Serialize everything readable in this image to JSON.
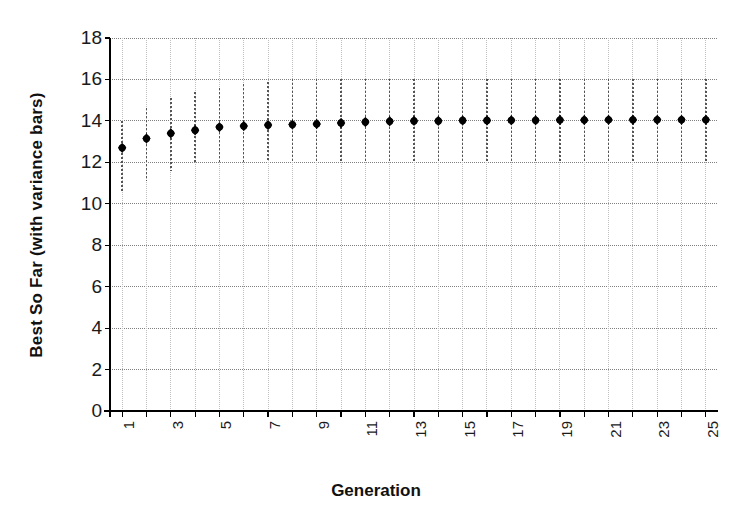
{
  "chart_data": {
    "type": "scatter",
    "title": "",
    "xlabel": "Generation",
    "ylabel": "Best So Far (with variance bars)",
    "xlim": [
      0.5,
      25.5
    ],
    "ylim": [
      0,
      18
    ],
    "grid": true,
    "legend": "none",
    "marker": "filled-diamond-circle",
    "error_bar_style": "dotted-vertical",
    "y_ticks": [
      0,
      2,
      4,
      6,
      8,
      10,
      12,
      14,
      16,
      18
    ],
    "x_ticks": [
      1,
      2,
      3,
      4,
      5,
      6,
      7,
      8,
      9,
      10,
      11,
      12,
      13,
      14,
      15,
      16,
      17,
      18,
      19,
      20,
      21,
      22,
      23,
      24,
      25
    ],
    "x_tick_labels_shown": [
      1,
      3,
      5,
      7,
      9,
      11,
      13,
      15,
      17,
      19,
      21,
      23,
      25
    ],
    "x": [
      1,
      2,
      3,
      4,
      5,
      6,
      7,
      8,
      9,
      10,
      11,
      12,
      13,
      14,
      15,
      16,
      17,
      18,
      19,
      20,
      21,
      22,
      23,
      24,
      25
    ],
    "values": [
      12.7,
      13.15,
      13.4,
      13.55,
      13.7,
      13.75,
      13.8,
      13.82,
      13.85,
      13.9,
      13.95,
      13.98,
      14.0,
      14.0,
      14.02,
      14.02,
      14.03,
      14.03,
      14.04,
      14.04,
      14.05,
      14.05,
      14.05,
      14.05,
      14.05
    ],
    "err_low": [
      10.5,
      11.1,
      11.6,
      12.0,
      12.0,
      12.0,
      12.0,
      12.0,
      12.0,
      12.0,
      12.0,
      12.0,
      12.0,
      12.0,
      12.0,
      12.0,
      12.0,
      12.0,
      12.0,
      12.0,
      12.0,
      12.0,
      12.0,
      12.0,
      12.0
    ],
    "err_high": [
      14.0,
      14.6,
      15.1,
      15.4,
      15.6,
      15.8,
      15.9,
      16.0,
      16.0,
      16.0,
      16.0,
      16.0,
      16.0,
      16.0,
      16.0,
      16.0,
      16.0,
      16.0,
      16.0,
      16.0,
      16.0,
      16.0,
      16.0,
      16.0,
      16.0
    ],
    "colors": {
      "marker": "#000000",
      "grid": "#808080",
      "axis": "#000000",
      "background": "#ffffff"
    }
  }
}
